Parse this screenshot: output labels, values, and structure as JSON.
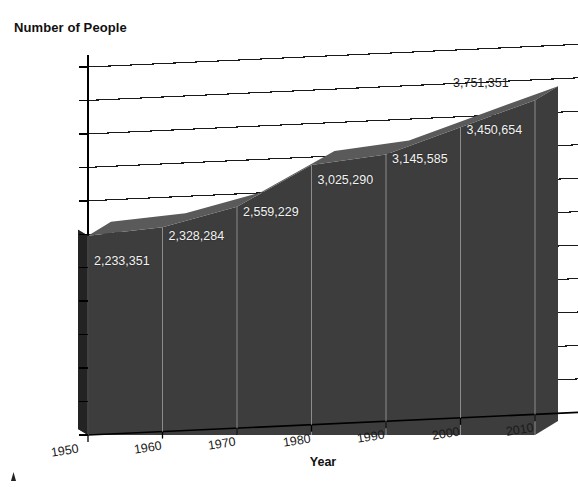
{
  "chart_data": {
    "type": "area",
    "title": "",
    "xlabel": "Year",
    "ylabel": "Number of People",
    "categories": [
      "1950",
      "1960",
      "1970",
      "1980",
      "1990",
      "2000",
      "2010"
    ],
    "x": [
      1950,
      1960,
      1970,
      1980,
      1990,
      2000,
      2010
    ],
    "values": [
      2233351,
      2328284,
      2559229,
      3025290,
      3145585,
      3450654,
      3751351
    ],
    "point_labels": [
      "2,233,351",
      "2,328,284",
      "2,559,229",
      "3,025,290",
      "3,145,585",
      "3,450,654",
      "3,751,351"
    ],
    "ylim": [
      0,
      4125000
    ],
    "ytick_step": 375000,
    "ytick_labels": [
      "0",
      "375,000",
      "750,000",
      "1,125,000",
      "1,500,000",
      "1,875,000",
      "2,250,000",
      "2,625,000",
      "3,000,000",
      "3,375,000",
      "3,750,000",
      "4,125,000"
    ],
    "ytick_values": [
      0,
      375000,
      750000,
      1125000,
      1500000,
      1875000,
      2250000,
      2625000,
      3000000,
      3375000,
      3750000,
      4125000
    ],
    "xtick_labels": [
      "1950",
      "1960",
      "1970",
      "1980",
      "1990",
      "2000",
      "2010"
    ],
    "grid": true,
    "legend": false,
    "legend_position": "none",
    "style": "3d-area",
    "colors": {
      "area_front": "#3d3d3d",
      "area_side": "#242424",
      "area_top": "#5a5a5a",
      "gridline": "#1a1a1a",
      "axis": "#000000",
      "label_text": "#1a1a1a",
      "data_label_text": "#f2f2f2",
      "background": "#ffffff"
    }
  },
  "axis_titles": {
    "y": "Number of People",
    "x": "Year"
  }
}
